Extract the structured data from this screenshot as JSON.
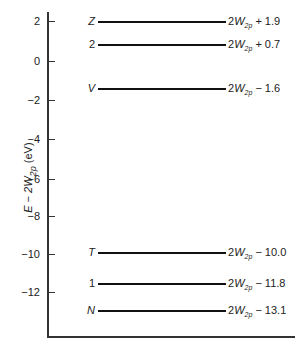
{
  "diagram": {
    "type": "energy-level diagram",
    "ylabel": "E − 2W2p (eV)",
    "ylabel_parts": {
      "pre": "E − 2",
      "var": "W",
      "sub": "2p",
      "post": " (eV)"
    },
    "y_ticks": [
      {
        "label": "2",
        "value": 2,
        "y": 21
      },
      {
        "label": "0",
        "value": 0,
        "y": 61
      },
      {
        "label": "−2",
        "value": -2,
        "y": 100
      },
      {
        "label": "−4",
        "value": -4,
        "y": 139
      },
      {
        "label": "−6",
        "value": -6,
        "y": 179
      },
      {
        "label": "−8",
        "value": -8,
        "y": 216
      },
      {
        "label": "−10",
        "value": -10,
        "y": 254
      },
      {
        "label": "−12",
        "value": -12,
        "y": 292
      }
    ],
    "levels": [
      {
        "state": "Z",
        "energy_prefix": "2",
        "energy_var": "W",
        "energy_sub": "2p",
        "offset": "+ 1.9",
        "value": 1.9,
        "y": 21
      },
      {
        "state": "2",
        "energy_prefix": "2",
        "energy_var": "W",
        "energy_sub": "2p",
        "offset": "+ 0.7",
        "value": 0.7,
        "y": 44
      },
      {
        "state": "V",
        "energy_prefix": "2",
        "energy_var": "W",
        "energy_sub": "2p",
        "offset": "− 1.6",
        "value": -1.6,
        "y": 88
      },
      {
        "state": "T",
        "energy_prefix": "2",
        "energy_var": "W",
        "energy_sub": "2p",
        "offset": "− 10.0",
        "value": -10.0,
        "y": 252
      },
      {
        "state": "1",
        "energy_prefix": "2",
        "energy_var": "W",
        "energy_sub": "2p",
        "offset": "− 11.8",
        "value": -11.8,
        "y": 283
      },
      {
        "state": "N",
        "energy_prefix": "2",
        "energy_var": "W",
        "energy_sub": "2p",
        "offset": "− 13.1",
        "value": -13.1,
        "y": 310
      }
    ]
  }
}
